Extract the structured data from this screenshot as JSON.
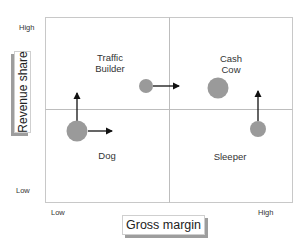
{
  "diagram": {
    "title": "",
    "axes": {
      "x": {
        "label": "Gross margin",
        "low_label": "Low",
        "high_label": "High"
      },
      "y": {
        "label": "Revenue share",
        "low_label": "Low",
        "high_label": "High"
      }
    },
    "quadrants": [
      {
        "id": "traffic-builder",
        "label_line1": "Traffic",
        "label_line2": "Builder",
        "position": "top-left"
      },
      {
        "id": "cash-cow",
        "label_line1": "Cash",
        "label_line2": "Cow",
        "position": "top-right"
      },
      {
        "id": "dog",
        "label_line1": "Dog",
        "label_line2": "",
        "position": "bottom-left"
      },
      {
        "id": "sleeper",
        "label_line1": "Sleeper",
        "label_line2": "",
        "position": "bottom-right"
      }
    ],
    "bubbles": [
      {
        "id": "dog-bubble",
        "quadrant": "dog",
        "cx": 77,
        "cy": 131,
        "r": 10,
        "arrows": [
          "up",
          "right"
        ]
      },
      {
        "id": "traffic-builder-bubble",
        "quadrant": "traffic-builder",
        "cx": 146,
        "cy": 86,
        "r": 7,
        "arrows": [
          "right"
        ]
      },
      {
        "id": "cash-cow-bubble",
        "quadrant": "cash-cow",
        "cx": 218,
        "cy": 88,
        "r": 10,
        "arrows": []
      },
      {
        "id": "sleeper-bubble",
        "quadrant": "sleeper",
        "cx": 258,
        "cy": 129,
        "r": 8,
        "arrows": [
          "up"
        ]
      }
    ],
    "colors": {
      "bubble_fill": "#9a9a9a",
      "grid_line": "#c8c8c8",
      "arrow": "#111111",
      "axis_box_shadow": "#9d9d9d"
    }
  }
}
